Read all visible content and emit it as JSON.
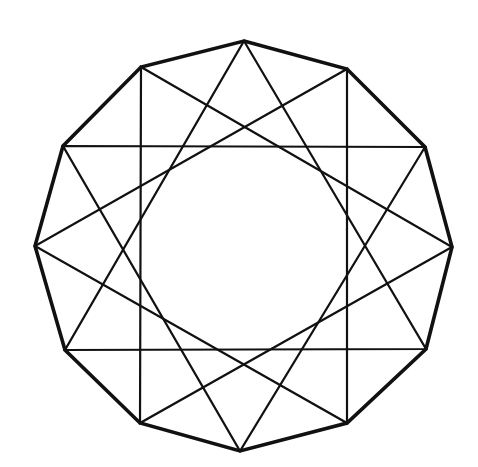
{
  "figure": {
    "stroke_color": "#111111",
    "background": "#ffffff",
    "vertices": [
      [
        244,
        41
      ],
      [
        347,
        69
      ],
      [
        425,
        147
      ],
      [
        452,
        247
      ],
      [
        426,
        349
      ],
      [
        347,
        423
      ],
      [
        240,
        451
      ],
      [
        140,
        423
      ],
      [
        65,
        350
      ],
      [
        35,
        246
      ],
      [
        63,
        146
      ],
      [
        141,
        67
      ]
    ],
    "outer_polygon": [
      0,
      1,
      2,
      3,
      4,
      5,
      6,
      7,
      8,
      9,
      10,
      11
    ],
    "triangles": [
      [
        0,
        4,
        8
      ],
      [
        1,
        5,
        9
      ],
      [
        2,
        6,
        10
      ],
      [
        3,
        7,
        11
      ]
    ]
  }
}
